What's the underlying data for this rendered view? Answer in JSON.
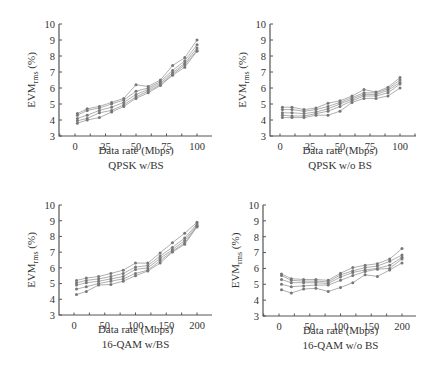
{
  "chart_data": [
    {
      "id": "qpsk_bs",
      "type": "line",
      "title": "QPSK w/BS",
      "xlabel": "Data rate (Mbps)",
      "ylabel": "EVMrms (%)",
      "ylabel_main": "EVM",
      "ylabel_sub": "rms",
      "ylabel_unit": " (%)",
      "xlim": [
        -12,
        112
      ],
      "ylim": [
        3,
        10
      ],
      "xticks": [
        0,
        25,
        50,
        75,
        100
      ],
      "yticks": [
        3,
        4,
        5,
        6,
        7,
        8,
        9,
        10
      ],
      "grid": false,
      "legend": "none",
      "x": [
        2,
        10,
        20,
        30,
        40,
        50,
        60,
        70,
        80,
        90,
        100
      ],
      "series": [
        {
          "name": "s1",
          "values": [
            4.4,
            4.7,
            4.85,
            5.1,
            5.35,
            6.2,
            6.1,
            6.5,
            7.4,
            7.9,
            9.0
          ]
        },
        {
          "name": "s2",
          "values": [
            4.3,
            4.6,
            4.75,
            5.0,
            5.25,
            5.8,
            6.0,
            6.4,
            7.1,
            7.7,
            8.7
          ]
        },
        {
          "name": "s3",
          "values": [
            4.1,
            4.3,
            4.6,
            4.8,
            5.1,
            5.6,
            5.9,
            6.3,
            6.95,
            7.55,
            8.5
          ]
        },
        {
          "name": "s4",
          "values": [
            3.95,
            4.1,
            4.45,
            4.6,
            4.95,
            5.45,
            5.8,
            6.2,
            6.85,
            7.45,
            8.35
          ]
        },
        {
          "name": "s5",
          "values": [
            3.8,
            4.0,
            4.15,
            4.5,
            4.85,
            5.35,
            5.7,
            6.15,
            6.8,
            7.3,
            8.3
          ]
        }
      ]
    },
    {
      "id": "qpsk_nobs",
      "type": "line",
      "title": "QPSK w/o BS",
      "xlabel": "Data rate (Mbps)",
      "ylabel": "EVMrms (%)",
      "ylabel_main": "EVM",
      "ylabel_sub": "rms",
      "ylabel_unit": " (%)",
      "xlim": [
        -8,
        108
      ],
      "ylim": [
        3,
        10
      ],
      "xticks": [
        0,
        25,
        50,
        75,
        100
      ],
      "yticks": [
        3,
        4,
        5,
        6,
        7,
        8,
        9,
        10
      ],
      "grid": false,
      "legend": "none",
      "x": [
        2,
        10,
        20,
        30,
        40,
        50,
        60,
        70,
        80,
        90,
        100
      ],
      "series": [
        {
          "name": "s1",
          "values": [
            4.8,
            4.8,
            4.65,
            4.75,
            5.05,
            5.2,
            5.5,
            5.9,
            5.75,
            6.05,
            6.65
          ]
        },
        {
          "name": "s2",
          "values": [
            4.65,
            4.65,
            4.55,
            4.65,
            4.85,
            5.1,
            5.4,
            5.7,
            5.7,
            5.95,
            6.5
          ]
        },
        {
          "name": "s3",
          "values": [
            4.45,
            4.45,
            4.4,
            4.5,
            4.7,
            5.0,
            5.3,
            5.6,
            5.6,
            5.85,
            6.35
          ]
        },
        {
          "name": "s4",
          "values": [
            4.3,
            4.25,
            4.25,
            4.4,
            4.55,
            4.85,
            5.2,
            5.5,
            5.5,
            5.7,
            6.25
          ]
        },
        {
          "name": "s5",
          "values": [
            4.15,
            4.15,
            4.15,
            4.3,
            4.3,
            4.55,
            5.1,
            5.35,
            5.35,
            5.5,
            6.0
          ]
        }
      ]
    },
    {
      "id": "qam16_bs",
      "type": "line",
      "title": "16-QAM w/BS",
      "xlabel": "Data rate (Mbps)",
      "ylabel": "EVMrms (%)",
      "ylabel_main": "EVM",
      "ylabel_sub": "rms",
      "ylabel_unit": " (%)",
      "xlim": [
        -24,
        224
      ],
      "ylim": [
        3,
        10
      ],
      "xticks": [
        0,
        50,
        100,
        150,
        200
      ],
      "yticks": [
        3,
        4,
        5,
        6,
        7,
        8,
        9,
        10
      ],
      "grid": false,
      "legend": "none",
      "x": [
        4,
        20,
        40,
        60,
        80,
        100,
        120,
        140,
        160,
        180,
        200
      ],
      "series": [
        {
          "name": "s1",
          "values": [
            5.2,
            5.35,
            5.45,
            5.65,
            5.85,
            6.3,
            6.3,
            6.95,
            7.6,
            8.2,
            8.9
          ]
        },
        {
          "name": "s2",
          "values": [
            5.05,
            5.2,
            5.3,
            5.45,
            5.65,
            6.05,
            6.15,
            6.75,
            7.3,
            7.9,
            8.8
          ]
        },
        {
          "name": "s3",
          "values": [
            4.9,
            5.05,
            5.15,
            5.3,
            5.45,
            5.9,
            6.0,
            6.6,
            7.15,
            7.75,
            8.7
          ]
        },
        {
          "name": "s4",
          "values": [
            4.65,
            4.8,
            5.0,
            5.15,
            5.3,
            5.65,
            5.85,
            6.45,
            7.05,
            7.6,
            8.65
          ]
        },
        {
          "name": "s5",
          "values": [
            4.3,
            4.5,
            4.9,
            4.95,
            5.15,
            5.5,
            5.8,
            6.3,
            7.0,
            7.5,
            8.6
          ]
        }
      ]
    },
    {
      "id": "qam16_nobs",
      "type": "line",
      "title": "16-QAM w/o BS",
      "xlabel": "Data rate (Mbps)",
      "ylabel": "EVMrms (%)",
      "ylabel_main": "EVM",
      "ylabel_sub": "rms",
      "ylabel_unit": " (%)",
      "xlim": [
        -16,
        222
      ],
      "ylim": [
        3,
        10
      ],
      "xticks": [
        0,
        50,
        100,
        150,
        200
      ],
      "yticks": [
        3,
        4,
        5,
        6,
        7,
        8,
        9,
        10
      ],
      "grid": false,
      "legend": "none",
      "x": [
        4,
        20,
        40,
        60,
        80,
        100,
        120,
        140,
        160,
        180,
        200
      ],
      "series": [
        {
          "name": "s1",
          "values": [
            5.65,
            5.35,
            5.3,
            5.3,
            5.25,
            5.7,
            6.05,
            6.2,
            6.3,
            6.6,
            7.25
          ]
        },
        {
          "name": "s2",
          "values": [
            5.55,
            5.25,
            5.2,
            5.2,
            5.15,
            5.6,
            5.85,
            6.05,
            6.15,
            6.45,
            6.85
          ]
        },
        {
          "name": "s3",
          "values": [
            5.3,
            5.1,
            5.1,
            5.1,
            5.05,
            5.45,
            5.75,
            5.9,
            6.0,
            6.2,
            6.7
          ]
        },
        {
          "name": "s4",
          "values": [
            5.0,
            4.85,
            4.9,
            4.95,
            4.95,
            5.25,
            5.55,
            5.8,
            5.95,
            6.0,
            6.6
          ]
        },
        {
          "name": "s5",
          "values": [
            4.65,
            4.45,
            4.7,
            4.75,
            4.55,
            4.8,
            5.1,
            5.6,
            5.5,
            5.9,
            6.35
          ]
        }
      ]
    }
  ]
}
